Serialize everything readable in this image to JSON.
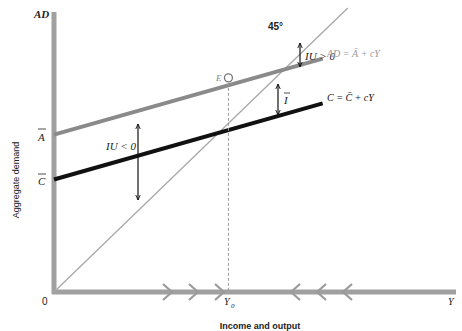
{
  "chart_data": {
    "type": "line",
    "title": "",
    "xlabel": "Income and output",
    "ylabel": "Aggregate demand",
    "y_axis_top_label": "AD",
    "x_axis_end_label": "Y",
    "origin_label": "0",
    "xlim": [
      0,
      100
    ],
    "ylim": [
      0,
      100
    ],
    "grid": false,
    "series": [
      {
        "name": "45° line",
        "label": "45°",
        "intercept": 0,
        "slope": 1.365,
        "color": "#a6a6a6"
      },
      {
        "name": "AD",
        "label": "AD = Ā + cY",
        "intercept": 55.4,
        "slope": 0.4,
        "color": "#8c8c8c"
      },
      {
        "name": "C",
        "label": "C = C̄ + cY",
        "intercept": 39.6,
        "slope": 0.4,
        "color": "#111111"
      }
    ],
    "y_ticks": [
      {
        "label": "Ā",
        "value": 55.4
      },
      {
        "label": "C̄",
        "value": 39.6
      }
    ],
    "x_ticks": [
      {
        "label": "Y₀",
        "value": 43.5
      }
    ],
    "equilibrium": {
      "label": "E",
      "x": 43.5,
      "y": 75.4
    },
    "annotations": [
      {
        "label": "IU > 0",
        "type": "double-arrow"
      },
      {
        "label": "IU < 0",
        "type": "double-arrow"
      },
      {
        "label": "Ī",
        "type": "double-arrow"
      }
    ],
    "axis_arrows": {
      "right_pointing": 3,
      "left_pointing": 3
    }
  },
  "labels": {
    "ad_axis": "AD",
    "aggregate_demand": "Aggregate demand",
    "income_output": "Income and output",
    "origin": "0",
    "y_end": "Y",
    "y0_main": "Y",
    "y0_sub": "0",
    "a_bar": "A",
    "c_bar": "C",
    "deg45": "45°",
    "e": "E",
    "iu_pos": "IU > 0",
    "iu_neg": "IU < 0",
    "i_bar": "I",
    "ad_eq": "AD = Ā + cY",
    "c_eq": "C = C̄ + cY"
  }
}
